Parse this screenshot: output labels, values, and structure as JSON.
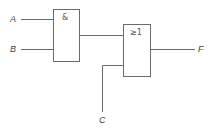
{
  "diagram": {
    "type": "logic-circuit",
    "inputs": [
      {
        "id": "A",
        "label": "A"
      },
      {
        "id": "B",
        "label": "B"
      },
      {
        "id": "C",
        "label": "C"
      }
    ],
    "gates": [
      {
        "id": "and1",
        "symbol": "&",
        "type": "AND",
        "inputs": [
          "A",
          "B"
        ]
      },
      {
        "id": "or1",
        "symbol": "≥1",
        "type": "OR",
        "inputs": [
          "and1",
          "C"
        ]
      }
    ],
    "output": {
      "id": "F",
      "label": "F",
      "from": "or1"
    }
  },
  "colors": {
    "line": "#6b6b6b",
    "text": "#444444",
    "background": "#ffffff"
  }
}
